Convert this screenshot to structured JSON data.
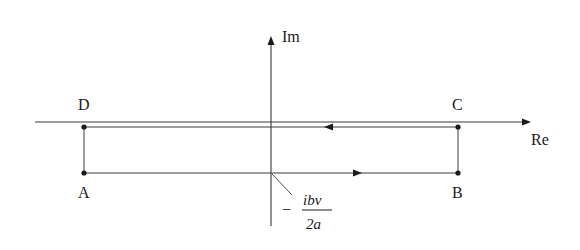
{
  "diagram": {
    "type": "complex-plane-contour",
    "axes": {
      "imaginary_label": "Im",
      "real_label": "Re"
    },
    "points": {
      "A": "A",
      "B": "B",
      "C": "C",
      "D": "D"
    },
    "annotation": {
      "sign": "−",
      "numerator": "ibv",
      "denominator": "2a"
    },
    "contour": {
      "lower_direction": "left-to-right (A to B)",
      "upper_direction": "right-to-left (C to D)"
    },
    "colors": {
      "line": "#3a3a3a",
      "text": "#1a1a1a",
      "background": "#ffffff"
    }
  }
}
